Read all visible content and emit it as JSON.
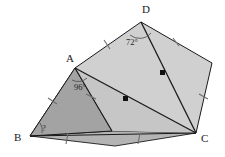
{
  "figure": {
    "type": "geometry-diagram",
    "background_color": "#ffffff",
    "stroke_color": "#1a1a1a",
    "fill_light": "#d2d2d2",
    "fill_mid": "#c3c3c3",
    "fill_dark": "#a8a8a8",
    "fill_darker": "#9a9a9a"
  },
  "vertices": [
    {
      "name": "A",
      "label": "A",
      "x": 75,
      "y": 68,
      "label_x": 66,
      "label_y": 62
    },
    {
      "name": "B",
      "label": "B",
      "x": 30,
      "y": 136,
      "label_x": 17,
      "label_y": 141
    },
    {
      "name": "C",
      "label": "C",
      "x": 196,
      "y": 133,
      "label_x": 202,
      "label_y": 141
    },
    {
      "name": "D",
      "label": "D",
      "x": 141,
      "y": 22,
      "label_x": 143,
      "label_y": 13
    },
    {
      "name": "E",
      "label": "",
      "x": 212,
      "y": 63,
      "label_x": 0,
      "label_y": 0
    }
  ],
  "angles": [
    {
      "at": "D",
      "label": "72°",
      "x": 131,
      "y": 42
    },
    {
      "at": "A",
      "label": "96°",
      "x": 80,
      "y": 86
    },
    {
      "at": "B",
      "label": "?",
      "x": 44,
      "y": 129
    }
  ],
  "edges": [
    {
      "name": "AD",
      "ticks": 1
    },
    {
      "name": "DE",
      "ticks": 1
    },
    {
      "name": "EC",
      "ticks": 1
    },
    {
      "name": "AB",
      "ticks": 1
    },
    {
      "name": "BC",
      "ticks": 2
    },
    {
      "name": "AF",
      "ticks": 1
    }
  ],
  "midpoint_dots": [
    {
      "on": "AC",
      "x": 126,
      "y": 99
    },
    {
      "on": "DC",
      "x": 163,
      "y": 73
    }
  ],
  "diagonals": [
    {
      "name": "A-C",
      "from": "A",
      "to": "C"
    },
    {
      "name": "D-C",
      "from": "D",
      "to": "C"
    },
    {
      "name": "A-F",
      "from": "A",
      "to": "bottom"
    }
  ]
}
